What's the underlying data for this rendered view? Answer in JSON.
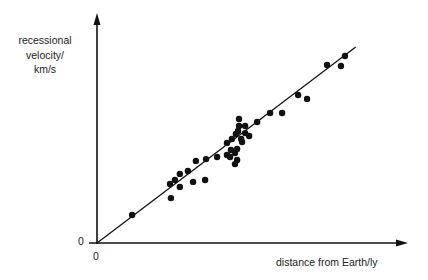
{
  "chart_data": {
    "type": "scatter",
    "title": "",
    "xlabel": "distance from Earth/ly",
    "ylabel_lines": [
      "recessional",
      "velocity/",
      "km/s"
    ],
    "ylabel": "recessional velocity/ km/s",
    "x_origin_label": "0",
    "y_origin_label": "0",
    "axis_units": "relative (0-100), no numeric tick labels shown",
    "xlim": [
      0,
      100
    ],
    "ylim": [
      0,
      100
    ],
    "grid": false,
    "legend": null,
    "best_fit_line": {
      "from": [
        0,
        0
      ],
      "to": [
        84,
        86
      ]
    },
    "points": [
      {
        "x": 11.4,
        "y": 12.3
      },
      {
        "x": 24.0,
        "y": 19.7
      },
      {
        "x": 23.7,
        "y": 25.9
      },
      {
        "x": 25.3,
        "y": 27.6
      },
      {
        "x": 26.9,
        "y": 24.6
      },
      {
        "x": 26.9,
        "y": 30.3
      },
      {
        "x": 29.5,
        "y": 31.6
      },
      {
        "x": 31.2,
        "y": 26.8
      },
      {
        "x": 32.1,
        "y": 36.0
      },
      {
        "x": 35.1,
        "y": 27.6
      },
      {
        "x": 35.4,
        "y": 36.8
      },
      {
        "x": 39.0,
        "y": 37.7
      },
      {
        "x": 42.2,
        "y": 38.6
      },
      {
        "x": 42.2,
        "y": 43.9
      },
      {
        "x": 43.2,
        "y": 37.7
      },
      {
        "x": 43.5,
        "y": 40.8
      },
      {
        "x": 43.8,
        "y": 45.6
      },
      {
        "x": 44.8,
        "y": 39.5
      },
      {
        "x": 44.8,
        "y": 34.6
      },
      {
        "x": 45.1,
        "y": 47.8
      },
      {
        "x": 45.5,
        "y": 36.4
      },
      {
        "x": 45.5,
        "y": 41.2
      },
      {
        "x": 45.8,
        "y": 49.1
      },
      {
        "x": 46.1,
        "y": 51.3
      },
      {
        "x": 46.1,
        "y": 54.4
      },
      {
        "x": 46.8,
        "y": 45.6
      },
      {
        "x": 47.1,
        "y": 44.3
      },
      {
        "x": 48.1,
        "y": 48.2
      },
      {
        "x": 48.1,
        "y": 51.3
      },
      {
        "x": 49.4,
        "y": 46.9
      },
      {
        "x": 52.0,
        "y": 53.1
      },
      {
        "x": 56.2,
        "y": 57.0
      },
      {
        "x": 60.1,
        "y": 57.0
      },
      {
        "x": 65.3,
        "y": 64.9
      },
      {
        "x": 68.2,
        "y": 63.2
      },
      {
        "x": 74.7,
        "y": 78.1
      },
      {
        "x": 79.2,
        "y": 77.6
      },
      {
        "x": 80.5,
        "y": 82.0
      }
    ]
  },
  "labels": {
    "ylabel_line1": "recessional",
    "ylabel_line2": "velocity/",
    "ylabel_line3": "km/s",
    "xlabel": "distance from Earth/ly",
    "zero_x": "0",
    "zero_y": "0"
  }
}
